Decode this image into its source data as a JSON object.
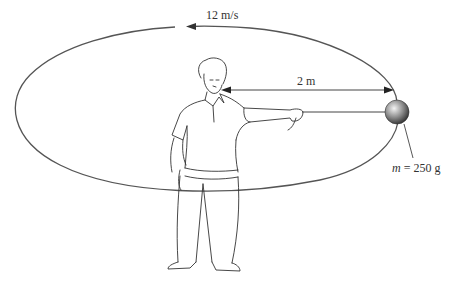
{
  "figure": {
    "type": "physics-diagram",
    "labels": {
      "speed": "12 m/s",
      "radius": "2 m",
      "mass_symbol": "m",
      "mass_value": "= 250 g"
    },
    "colors": {
      "line": "#444444",
      "ball_light": "#f0f0f0",
      "ball_dark": "#3a3a3a",
      "background": "#ffffff"
    }
  }
}
